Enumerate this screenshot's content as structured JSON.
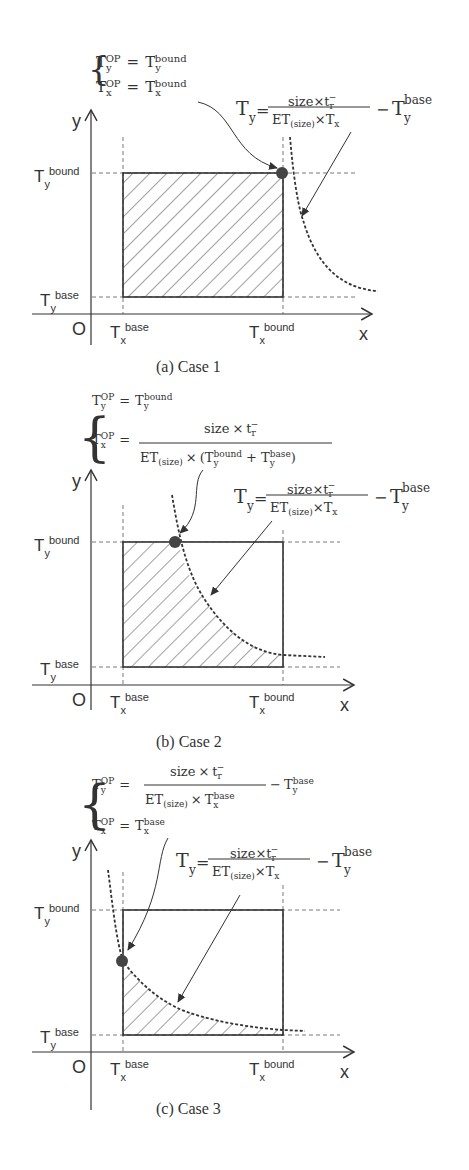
{
  "panels": [
    {
      "id": "a",
      "caption": "(a)   Case 1",
      "op_equations": [
        "T_y^OP = T_y^bound",
        "T_x^OP = T_x^bound"
      ],
      "curve_equation": "T_y = size×t_r^- / (ET(size)×T_x) − T_y^base",
      "op_point": "top-right corner (T_x^bound, T_y^bound)"
    },
    {
      "id": "b",
      "caption": "(b)   Case 2",
      "op_equations": [
        "T_y^OP = T_y^bound",
        "T_x^OP = size × t_r^- / (ET(size) × (T_y^bound + T_y^base))"
      ],
      "curve_equation": "T_y = size×t_r^- / (ET(size)×T_x) − T_y^base",
      "op_point": "on top edge where curve crosses T_y^bound"
    },
    {
      "id": "c",
      "caption": "(c)   Case 3",
      "op_equations": [
        "T_y^OP = size × t_r^- / (ET(size) × T_x^base) − T_y^base",
        "T_x^OP = T_x^base"
      ],
      "curve_equation": "T_y = size×t_r^- / (ET(size)×T_x) − T_y^base",
      "op_point": "on left edge where curve crosses T_x^base"
    }
  ],
  "labels": {
    "axis_y": "y",
    "axis_x": "x",
    "origin": "O",
    "T": "T",
    "sub_y": "y",
    "sub_x": "x",
    "bound": "bound",
    "base": "base",
    "op": "OP",
    "size": "size",
    "times": "×",
    "t": "t",
    "r": "r",
    "minus_sup": "−",
    "ET": "ET",
    "size_paren": "(size)",
    "eq": "=",
    "minus": "−",
    "plus": "+",
    "lparen": "(",
    "rparen": ")"
  },
  "colors": {
    "ink": "#333333",
    "dot": "#444444",
    "dash": "#555555"
  }
}
